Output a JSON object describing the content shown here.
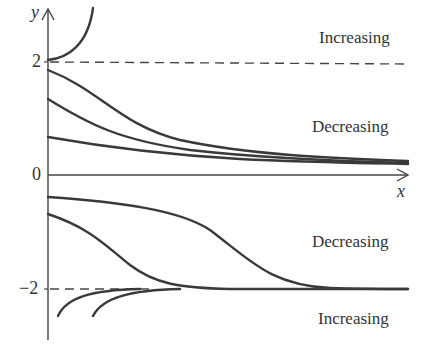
{
  "diagram": {
    "type": "direction-field-solution-curves",
    "axes": {
      "x_label": "x",
      "y_label": "y",
      "y_ticks": [
        "2",
        "0",
        "−2"
      ]
    },
    "equilibria": [
      {
        "y": 2,
        "style": "dashed"
      },
      {
        "y": -2,
        "style": "dashed"
      }
    ],
    "region_labels": [
      {
        "id": "above-2",
        "text": "Increasing"
      },
      {
        "id": "between-0-2",
        "text": "Decreasing"
      },
      {
        "id": "between-minus2-0",
        "text": "Decreasing"
      },
      {
        "id": "below-minus2",
        "text": "Increasing"
      }
    ],
    "colors": {
      "curve": "#3a3a3a",
      "axis": "#444444",
      "dashed": "#444444",
      "background": "#ffffff"
    }
  }
}
